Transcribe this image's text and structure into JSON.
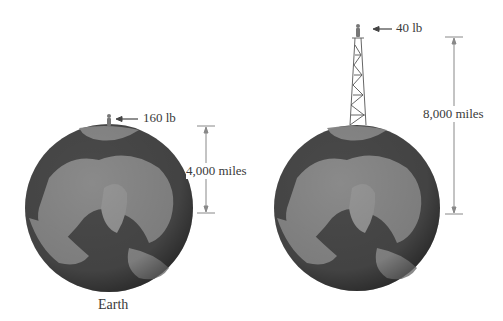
{
  "left_panel": {
    "person_weight": "160 lb",
    "distance_label": "4,000 miles",
    "caption": "Earth"
  },
  "right_panel": {
    "person_weight": "40 lb",
    "distance_label": "8,000 miles"
  },
  "colors": {
    "ocean": "#4a4a4a",
    "land": "#8a8a8a",
    "line": "#888888"
  }
}
